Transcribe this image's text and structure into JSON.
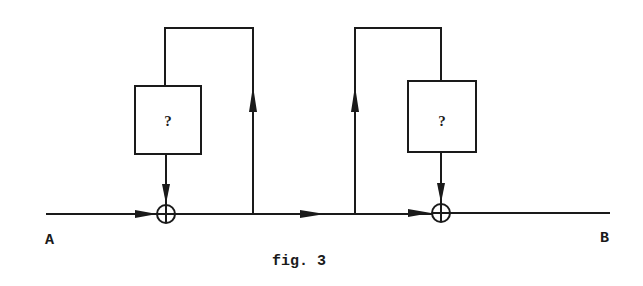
{
  "figure": {
    "caption": "fig. 3",
    "input_label": "A",
    "output_label": "B",
    "stroke_color": "#1a1a1a",
    "background": "#ffffff"
  },
  "blocks": [
    {
      "id": "block-1",
      "label": "?"
    },
    {
      "id": "block-2",
      "label": "?"
    }
  ],
  "junctions": [
    {
      "id": "sum-1",
      "symbol": "⊕"
    },
    {
      "id": "sum-2",
      "symbol": "⊕"
    }
  ]
}
